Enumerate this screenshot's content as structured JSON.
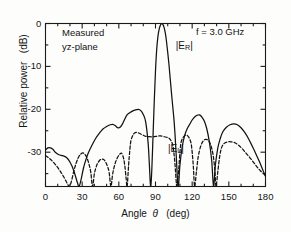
{
  "figure": {
    "annotations": {
      "measured": "Measured",
      "plane": "yz-plane",
      "frequency": "f = 3.0 GHz"
    },
    "curve_labels": {
      "right": "|E",
      "right_sub": "R",
      "right_end": "|",
      "left": "|E",
      "left_sub": "L",
      "left_end": "|"
    }
  },
  "chart_data": {
    "type": "line",
    "title": "",
    "xlabel_parts": {
      "word": "Angle",
      "symbol": "θ",
      "unit": "(deg)"
    },
    "xlabel": "Angle θ (deg)",
    "ylabel_parts": {
      "word": "Relative power",
      "unit": "(dB)"
    },
    "ylabel": "Relative power (dB)",
    "xlim": [
      0,
      180
    ],
    "ylim": [
      -38,
      0
    ],
    "xticks": [
      0,
      30,
      60,
      90,
      120,
      150,
      180
    ],
    "xtick_labels": [
      "0",
      "30",
      "60",
      "90",
      "120",
      "150",
      "180"
    ],
    "yticks": [
      0,
      -10,
      -20,
      -30
    ],
    "ytick_labels": [
      "0",
      "-10",
      "-20",
      "-30"
    ],
    "xminor_step": 10,
    "yminor_step": 5,
    "grid": false,
    "legend": "inline-annotation",
    "units": {
      "x": "deg",
      "y": "dB"
    },
    "series": [
      {
        "name": "|E_R|",
        "style": "solid",
        "label_x": 100,
        "label_y": -5.5,
        "points": [
          [
            0,
            -29.5
          ],
          [
            2,
            -29.0
          ],
          [
            4,
            -29.0
          ],
          [
            6,
            -29.3
          ],
          [
            8,
            -30.0
          ],
          [
            11,
            -30.6
          ],
          [
            14,
            -30.8
          ],
          [
            17,
            -31.2
          ],
          [
            20,
            -32.3
          ],
          [
            23,
            -34.2
          ],
          [
            26,
            -37.0
          ],
          [
            27.5,
            -38.5
          ],
          [
            29,
            -36.5
          ],
          [
            31,
            -33.8
          ],
          [
            33,
            -31.8
          ],
          [
            35,
            -30.2
          ],
          [
            38,
            -28.4
          ],
          [
            41,
            -26.8
          ],
          [
            44,
            -25.6
          ],
          [
            47,
            -24.6
          ],
          [
            50,
            -24.0
          ],
          [
            53,
            -23.6
          ],
          [
            55,
            -23.5
          ],
          [
            57,
            -23.8
          ],
          [
            59,
            -24.3
          ],
          [
            61,
            -24.2
          ],
          [
            63,
            -23.4
          ],
          [
            65,
            -22.2
          ],
          [
            67,
            -21.2
          ],
          [
            70,
            -20.6
          ],
          [
            73,
            -20.2
          ],
          [
            76,
            -20.0
          ],
          [
            78,
            -20.3
          ],
          [
            80,
            -21.2
          ],
          [
            82,
            -23.0
          ],
          [
            84,
            -28.0
          ],
          [
            85,
            -33.0
          ],
          [
            86,
            -38.5
          ],
          [
            87,
            -34.0
          ],
          [
            88,
            -26.0
          ],
          [
            89,
            -18.0
          ],
          [
            90,
            -11.0
          ],
          [
            91,
            -6.0
          ],
          [
            92,
            -3.0
          ],
          [
            93,
            -1.3
          ],
          [
            94,
            -0.4
          ],
          [
            95,
            -0.05
          ],
          [
            96,
            -0.2
          ],
          [
            97,
            -0.9
          ],
          [
            98,
            -2.2
          ],
          [
            99,
            -4.2
          ],
          [
            101,
            -9.5
          ],
          [
            103,
            -16.0
          ],
          [
            105,
            -22.0
          ],
          [
            106,
            -26.0
          ],
          [
            107,
            -31.0
          ],
          [
            108,
            -36.5
          ],
          [
            108.8,
            -38.5
          ],
          [
            110,
            -33.0
          ],
          [
            112,
            -28.5
          ],
          [
            114,
            -26.0
          ],
          [
            116,
            -24.5
          ],
          [
            118,
            -23.5
          ],
          [
            120,
            -22.5
          ],
          [
            122,
            -21.8
          ],
          [
            124,
            -21.4
          ],
          [
            126,
            -21.3
          ],
          [
            128,
            -21.8
          ],
          [
            130,
            -22.8
          ],
          [
            132,
            -24.6
          ],
          [
            134,
            -27.5
          ],
          [
            136,
            -32.0
          ],
          [
            137.5,
            -38.5
          ],
          [
            139,
            -33.0
          ],
          [
            141,
            -29.0
          ],
          [
            143,
            -26.8
          ],
          [
            145,
            -25.3
          ],
          [
            148,
            -24.2
          ],
          [
            151,
            -23.6
          ],
          [
            154,
            -23.4
          ],
          [
            157,
            -23.6
          ],
          [
            160,
            -24.3
          ],
          [
            163,
            -25.4
          ],
          [
            166,
            -26.8
          ],
          [
            169,
            -28.5
          ],
          [
            172,
            -30.3
          ],
          [
            175,
            -32.2
          ],
          [
            178,
            -34.3
          ],
          [
            180,
            -35.6
          ]
        ]
      },
      {
        "name": "|E_L|",
        "style": "dashed",
        "label_x": 92,
        "label_y": -29.5,
        "points": [
          [
            0,
            -30.8
          ],
          [
            3,
            -31.4
          ],
          [
            6,
            -32.2
          ],
          [
            9,
            -33.2
          ],
          [
            12,
            -34.4
          ],
          [
            15,
            -35.8
          ],
          [
            18,
            -37.4
          ],
          [
            19.5,
            -38.5
          ],
          [
            21,
            -37.0
          ],
          [
            23,
            -34.6
          ],
          [
            25,
            -32.6
          ],
          [
            27,
            -31.2
          ],
          [
            29,
            -30.4
          ],
          [
            31,
            -30.2
          ],
          [
            33,
            -30.8
          ],
          [
            35,
            -32.2
          ],
          [
            37,
            -34.6
          ],
          [
            38.5,
            -38.5
          ],
          [
            40,
            -35.0
          ],
          [
            42,
            -33.0
          ],
          [
            44,
            -32.0
          ],
          [
            46,
            -31.6
          ],
          [
            48,
            -31.8
          ],
          [
            50,
            -32.8
          ],
          [
            52,
            -34.6
          ],
          [
            53.5,
            -38.5
          ],
          [
            55,
            -35.0
          ],
          [
            57,
            -32.6
          ],
          [
            59,
            -31.2
          ],
          [
            61,
            -30.4
          ],
          [
            62,
            -30.2
          ],
          [
            63,
            -30.6
          ],
          [
            64,
            -31.6
          ],
          [
            65,
            -33.4
          ],
          [
            66,
            -36.2
          ],
          [
            66.8,
            -38.5
          ],
          [
            68,
            -33.0
          ],
          [
            69,
            -29.5
          ],
          [
            70,
            -27.2
          ],
          [
            72,
            -25.8
          ],
          [
            74,
            -25.4
          ],
          [
            76,
            -25.5
          ],
          [
            79,
            -25.9
          ],
          [
            82,
            -26.3
          ],
          [
            85,
            -26.4
          ],
          [
            88,
            -26.4
          ],
          [
            91,
            -26.3
          ],
          [
            94,
            -26.2
          ],
          [
            97,
            -26.4
          ],
          [
            100,
            -26.6
          ],
          [
            102,
            -27.0
          ],
          [
            104,
            -28.2
          ],
          [
            105,
            -30.0
          ],
          [
            106,
            -33.0
          ],
          [
            107,
            -37.0
          ],
          [
            107.6,
            -38.5
          ],
          [
            109,
            -34.0
          ],
          [
            110,
            -30.0
          ],
          [
            111,
            -27.6
          ],
          [
            113,
            -26.4
          ],
          [
            115,
            -26.0
          ],
          [
            117,
            -26.4
          ],
          [
            119,
            -27.8
          ],
          [
            120,
            -30.0
          ],
          [
            121,
            -33.5
          ],
          [
            122,
            -38.5
          ],
          [
            123.5,
            -34.5
          ],
          [
            125,
            -31.0
          ],
          [
            127,
            -28.6
          ],
          [
            129,
            -27.4
          ],
          [
            131,
            -27.0
          ],
          [
            133,
            -27.2
          ],
          [
            135,
            -28.2
          ],
          [
            137,
            -30.4
          ],
          [
            138.5,
            -34.0
          ],
          [
            139.5,
            -38.5
          ],
          [
            141,
            -34.5
          ],
          [
            142.5,
            -31.0
          ],
          [
            144,
            -29.0
          ],
          [
            146,
            -28.0
          ],
          [
            149,
            -27.6
          ],
          [
            152,
            -27.6
          ],
          [
            155,
            -27.8
          ],
          [
            158,
            -28.4
          ],
          [
            161,
            -29.2
          ],
          [
            164,
            -30.2
          ],
          [
            167,
            -31.2
          ],
          [
            170,
            -32.3
          ],
          [
            173,
            -33.4
          ],
          [
            176,
            -34.4
          ],
          [
            180,
            -35.4
          ]
        ]
      }
    ]
  }
}
